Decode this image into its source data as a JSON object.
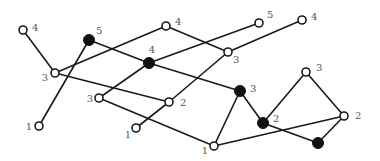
{
  "diagram": {
    "type": "graph",
    "nodes": [
      {
        "id": "A",
        "x": 23,
        "y": 30,
        "filled": false,
        "label": "4",
        "lx": 32,
        "ly": 31,
        "anchor": "start"
      },
      {
        "id": "B",
        "x": 89,
        "y": 40,
        "filled": true,
        "label": "5",
        "lx": 96,
        "ly": 34,
        "anchor": "start"
      },
      {
        "id": "C",
        "x": 166,
        "y": 26,
        "filled": false,
        "label": "4",
        "lx": 175,
        "ly": 25,
        "anchor": "start"
      },
      {
        "id": "D",
        "x": 259,
        "y": 23,
        "filled": false,
        "label": "5",
        "lx": 267,
        "ly": 18,
        "anchor": "start"
      },
      {
        "id": "E",
        "x": 302,
        "y": 20,
        "filled": false,
        "label": "4",
        "lx": 311,
        "ly": 20,
        "anchor": "start"
      },
      {
        "id": "F",
        "x": 55,
        "y": 73,
        "filled": false,
        "label": "3",
        "lx": 48,
        "ly": 81,
        "anchor": "end"
      },
      {
        "id": "G",
        "x": 149,
        "y": 63,
        "filled": true,
        "label": "4",
        "lx": 152,
        "ly": 53,
        "anchor": "middle"
      },
      {
        "id": "H",
        "x": 228,
        "y": 52,
        "filled": false,
        "label": "3",
        "lx": 233,
        "ly": 63,
        "anchor": "start"
      },
      {
        "id": "I",
        "x": 99,
        "y": 98,
        "filled": false,
        "label": "3",
        "lx": 93,
        "ly": 102,
        "anchor": "end"
      },
      {
        "id": "J",
        "x": 169,
        "y": 102,
        "filled": false,
        "label": "2",
        "lx": 180,
        "ly": 106,
        "anchor": "start"
      },
      {
        "id": "K",
        "x": 39,
        "y": 126,
        "filled": false,
        "label": "1",
        "lx": 32,
        "ly": 130,
        "anchor": "end"
      },
      {
        "id": "L",
        "x": 136,
        "y": 128,
        "filled": false,
        "label": "1",
        "lx": 131,
        "ly": 138,
        "anchor": "end"
      },
      {
        "id": "M",
        "x": 240,
        "y": 91,
        "filled": true,
        "label": "3",
        "lx": 250,
        "ly": 92,
        "anchor": "start"
      },
      {
        "id": "N",
        "x": 306,
        "y": 72,
        "filled": false,
        "label": "3",
        "lx": 316,
        "ly": 71,
        "anchor": "start"
      },
      {
        "id": "O",
        "x": 263,
        "y": 123,
        "filled": true,
        "label": "2",
        "lx": 273,
        "ly": 122,
        "anchor": "start"
      },
      {
        "id": "P",
        "x": 344,
        "y": 116,
        "filled": false,
        "label": "2",
        "lx": 355,
        "ly": 119,
        "anchor": "start"
      },
      {
        "id": "Q",
        "x": 318,
        "y": 143,
        "filled": true,
        "label": "",
        "lx": 0,
        "ly": 0,
        "anchor": "start"
      },
      {
        "id": "R",
        "x": 214,
        "y": 146,
        "filled": false,
        "label": "1",
        "lx": 208,
        "ly": 154,
        "anchor": "end"
      }
    ],
    "edges": [
      [
        "A",
        "F"
      ],
      [
        "F",
        "C"
      ],
      [
        "F",
        "J"
      ],
      [
        "B",
        "K"
      ],
      [
        "B",
        "G"
      ],
      [
        "G",
        "M"
      ],
      [
        "G",
        "D"
      ],
      [
        "G",
        "I"
      ],
      [
        "C",
        "H"
      ],
      [
        "H",
        "E"
      ],
      [
        "H",
        "J"
      ],
      [
        "J",
        "L"
      ],
      [
        "I",
        "R"
      ],
      [
        "R",
        "M"
      ],
      [
        "R",
        "P"
      ],
      [
        "M",
        "O"
      ],
      [
        "O",
        "N"
      ],
      [
        "N",
        "P"
      ],
      [
        "O",
        "Q"
      ],
      [
        "Q",
        "P"
      ]
    ]
  }
}
